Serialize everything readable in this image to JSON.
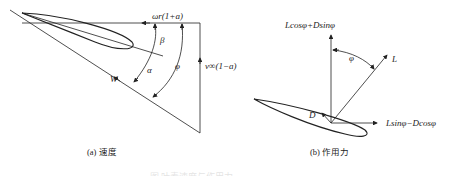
{
  "panel_a": {
    "labels": {
      "omega_r": "ωr(1+a)",
      "beta": "β",
      "alpha": "α",
      "phi": "φ",
      "W": "W",
      "v_inf": "v∞(1−a)"
    },
    "caption": "(a) 速度"
  },
  "panel_b": {
    "labels": {
      "vertical_force": "Lcosφ+Dsinφ",
      "phi": "φ",
      "L": "L",
      "D": "D",
      "horizontal_force": "Lsinφ−Dcosφ"
    },
    "caption": "(b) 作用力"
  },
  "figure_caption": "图 叶素速度与作用力"
}
